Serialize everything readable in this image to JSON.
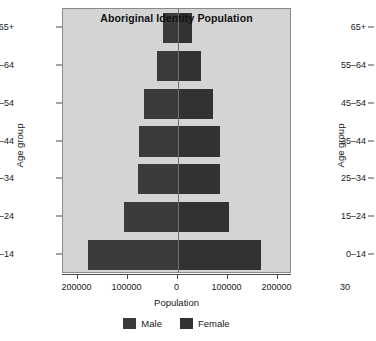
{
  "chart": {
    "title": "Aboriginal Identity Population",
    "xlabel": "Population",
    "ylabel": "Age group",
    "legend": [
      {
        "label": "Male",
        "color": "#3b3b3b"
      },
      {
        "label": "Female",
        "color": "#323232"
      }
    ],
    "xticks": [
      "200000",
      "100000",
      "0",
      "100000",
      "200000"
    ],
    "panel_color": "#d4d4d4"
  },
  "chart_data": {
    "type": "bar",
    "subtype": "population-pyramid",
    "title": "Aboriginal Identity Population",
    "xlabel": "Population",
    "ylabel": "Age group",
    "categories": [
      "0–14",
      "15–24",
      "25–34",
      "35–44",
      "45–54",
      "55–64",
      "65+"
    ],
    "series": [
      {
        "name": "Male",
        "direction": "left",
        "values": [
          180000,
          107000,
          80000,
          78000,
          67000,
          41000,
          29000
        ]
      },
      {
        "name": "Female",
        "direction": "right",
        "values": [
          167000,
          102000,
          84000,
          84000,
          70000,
          47000,
          29000
        ]
      }
    ],
    "xlim": [
      -229000,
      229000
    ],
    "xtick_values": [
      -200000,
      -100000,
      0,
      100000,
      200000
    ],
    "xtick_labels": [
      "200000",
      "100000",
      "0",
      "100000",
      "200000"
    ],
    "grid": false,
    "legend_position": "bottom"
  },
  "chart2": {
    "ylabel": "Age group",
    "categories": [
      "65+",
      "55–64",
      "45–54",
      "35–44",
      "25–34",
      "15–24",
      "0–14"
    ],
    "xtick_partial": "30"
  }
}
